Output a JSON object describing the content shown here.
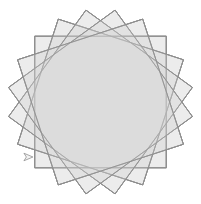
{
  "canvas": {
    "width": 201,
    "height": 204,
    "background_color": "#ffffff",
    "title": "Turtle Graphics Rotated Squares"
  },
  "figure": {
    "name": "rotated-square-rosette",
    "center_x": 100.5,
    "center_y": 102.0,
    "square_count": 20,
    "rotation_step_degrees": 18,
    "start_angle_degrees": 0,
    "square_half_diagonal": 93,
    "stroke_color": "#8c8c8c",
    "stroke_width": 0.85,
    "fill_color": "#d9d9d9",
    "fill_opacity": 0.17,
    "inner_circle_radius": 66,
    "inner_circle_fill": "#ececec"
  },
  "turtle_cursor": {
    "name": "turtle-arrow-cursor",
    "x": 28,
    "y": 157,
    "heading_degrees": 0,
    "size": 9,
    "stroke_color": "#909090",
    "fill_color": "#f2f2f2",
    "visible": "true"
  },
  "chart_data": {
    "type": "scatter",
    "xlabel": "",
    "ylabel": "",
    "categories": [],
    "values": [],
    "grid": "off",
    "legend_position": "none",
    "annotations": [
      "20 squares at 18 degree increments",
      "common centre at canvas midpoint",
      "turtle pointer parked at lower left"
    ]
  }
}
